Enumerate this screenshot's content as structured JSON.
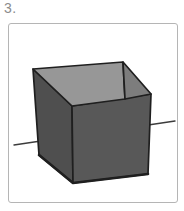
{
  "item": {
    "label": "3."
  },
  "figure": {
    "name": "cube-on-axis-drawing",
    "colors": {
      "background": "#ffffff",
      "frame_border": "#b5b5b5",
      "label_text": "#8c8c8c",
      "outline": "#1f1f1f",
      "left_face": "#4f4f4f",
      "front_face": "#585858",
      "top_face": "#979797",
      "inner_right_face": "#7d7d7d",
      "axis_line": "#3c3c3c"
    },
    "geometry": {
      "axis": {
        "x1": 14,
        "y1": 145,
        "x2": 175,
        "y2": 121
      },
      "vertices": {
        "A": [
          33,
          69
        ],
        "B": [
          123,
          62
        ],
        "C": [
          151,
          94
        ],
        "D": [
          72,
          106
        ],
        "E": [
          125,
          99
        ],
        "F": [
          73,
          183
        ],
        "G": [
          148,
          174
        ],
        "H": [
          39,
          155
        ]
      },
      "bottom_edge_path": "M 39 155 L 73 183 L 148 174"
    }
  }
}
